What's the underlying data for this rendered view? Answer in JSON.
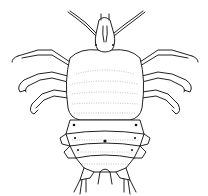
{
  "illustration": {
    "subject": "louse line drawing",
    "view": "dorsal",
    "style": "black ink line art on white",
    "colors": {
      "background": "#ffffff",
      "ink": "#222222",
      "stipple": "#9a9a9a"
    }
  }
}
